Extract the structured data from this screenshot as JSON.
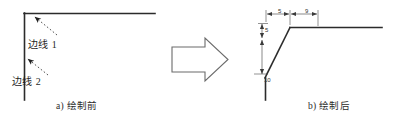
{
  "figure": {
    "title_a": "a) 绘制前",
    "title_b": "b) 绘制后",
    "transition_icon": "right-block-arrow-icon",
    "before": {
      "labels": [
        {
          "id": "edge-1",
          "text": "边线 1"
        },
        {
          "id": "edge-2",
          "text": "边线 2"
        }
      ],
      "geometry": {
        "corner": {
          "x": 24,
          "y": 13
        },
        "horizontal_line_end_x": 155,
        "vertical_line_end_y": 100
      }
    },
    "after": {
      "dimensions": [
        {
          "id": "dim-top-left",
          "text": "5",
          "orientation": "horizontal"
        },
        {
          "id": "dim-top-right",
          "text": "9",
          "orientation": "horizontal"
        },
        {
          "id": "dim-vert-top",
          "text": "5",
          "orientation": "vertical"
        },
        {
          "id": "dim-vert-bot",
          "text": "10",
          "orientation": "vertical"
        }
      ],
      "geometry": {
        "corner_x": 290,
        "top_y": 27,
        "chamfer_start": {
          "x": 290,
          "y": 27
        },
        "chamfer_end": {
          "x": 265,
          "y": 78
        },
        "horizontal_line_end_x": 382,
        "vertical_line_end_y": 100
      }
    },
    "colors": {
      "line": "#2b2b2b",
      "dimension": "#3a3a3a",
      "arrow_outline": "#6b6b6b",
      "background": "#ffffff"
    }
  }
}
